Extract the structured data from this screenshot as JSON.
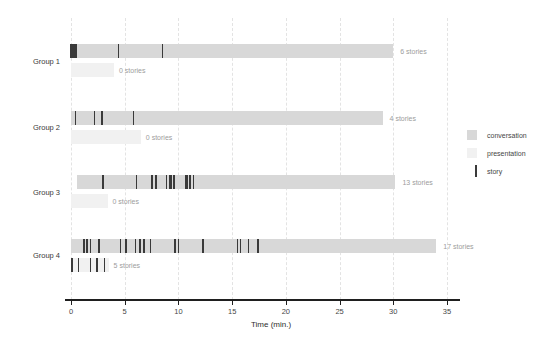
{
  "chart_data": {
    "type": "bar",
    "subtype": "timeline-gantt",
    "xlabel": "Time (min.)",
    "xlim": [
      0,
      35
    ],
    "x_ticks": [
      0,
      5,
      10,
      15,
      20,
      25,
      30,
      35
    ],
    "grid": "vertical-dashed",
    "legend_position": "right",
    "groups": [
      {
        "label": "Group 1",
        "conversation": {
          "start": 0,
          "end": 30.0,
          "stories_label": "6 stories",
          "story_times": [
            0.0,
            0.15,
            0.3,
            0.45,
            4.4,
            8.5
          ]
        },
        "presentation": {
          "start": 0,
          "end": 4.0,
          "stories_label": "0 stories",
          "story_times": []
        }
      },
      {
        "label": "Group 2",
        "conversation": {
          "start": 0,
          "end": 29.0,
          "stories_label": "4 stories",
          "story_times": [
            0.4,
            2.2,
            2.9,
            5.8
          ]
        },
        "presentation": {
          "start": 0,
          "end": 6.5,
          "stories_label": "0 stories",
          "story_times": []
        }
      },
      {
        "label": "Group 3",
        "conversation": {
          "start": 0.6,
          "end": 30.2,
          "stories_label": "13 stories",
          "story_times": [
            3.0,
            6.1,
            7.5,
            7.6,
            7.9,
            8.9,
            9.2,
            9.3,
            9.6,
            10.7,
            10.8,
            11.1,
            11.4
          ]
        },
        "presentation": {
          "start": 0,
          "end": 3.4,
          "stories_label": "0 stories",
          "story_times": []
        }
      },
      {
        "label": "Group 4",
        "conversation": {
          "start": 0,
          "end": 34.0,
          "stories_label": "17 stories",
          "story_times": [
            1.2,
            1.5,
            1.8,
            2.6,
            4.6,
            5.1,
            6.0,
            6.4,
            6.8,
            7.4,
            9.7,
            10.0,
            12.3,
            15.5,
            15.8,
            16.5,
            17.4
          ]
        },
        "presentation": {
          "start": 0,
          "end": 3.5,
          "stories_label": "5 stories",
          "story_times": [
            0.1,
            0.7,
            1.8,
            2.4,
            3.1
          ]
        }
      }
    ],
    "legend": [
      {
        "label": "conversation",
        "swatch": "fill",
        "color": "#d8d8d8"
      },
      {
        "label": "presentation",
        "swatch": "fill",
        "color": "#f1f1f1"
      },
      {
        "label": "story",
        "swatch": "line",
        "color": "#3a3a3a"
      }
    ],
    "colors": {
      "conversation": "#d8d8d8",
      "presentation": "#f1f1f1",
      "story": "#3a3a3a",
      "axis": "#1f1f1f",
      "gridline": "#e3e3e3",
      "stories_text": "#9c9c9c",
      "label_text": "#3a3a3a"
    }
  }
}
